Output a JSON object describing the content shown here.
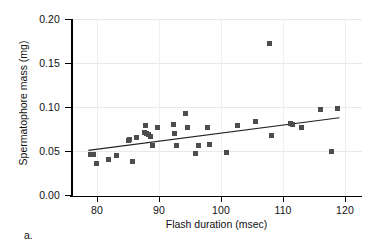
{
  "figure": {
    "panel_letter": "a.",
    "background": "#ffffff",
    "marker_color": "#4d4d4d",
    "axis_color": "#000000",
    "grid_color": "#e9e9e9"
  },
  "chart_data": {
    "type": "scatter",
    "title": "",
    "xlabel": "Flash duration (msec)",
    "ylabel": "Spermatophore mass (mg)",
    "xlim": [
      75.2,
      122.5
    ],
    "ylim": [
      0.0,
      0.205
    ],
    "xticks": [
      80,
      90,
      100,
      110,
      120
    ],
    "xticklabels": [
      "80",
      "90",
      "100",
      "110",
      "120"
    ],
    "yticks": [
      0.0,
      0.05,
      0.1,
      0.15,
      0.2
    ],
    "yticklabels": [
      "0.00",
      "0.05",
      "0.10",
      "0.15",
      "0.20"
    ],
    "grid": true,
    "legend": null,
    "x": [
      78.9,
      79.5,
      79.9,
      81.9,
      83.2,
      85.1,
      85.3,
      85.8,
      86.3,
      87.6,
      87.9,
      88.0,
      88.3,
      88.6,
      88.9,
      89.8,
      92.3,
      92.5,
      92.8,
      94.2,
      94.6,
      95.9,
      96.3,
      97.8,
      98.1,
      100.9,
      102.7,
      105.6,
      107.9,
      108.1,
      111.2,
      111.5,
      113.0,
      116.0,
      117.9,
      118.8
    ],
    "y": [
      0.047,
      0.047,
      0.037,
      0.041,
      0.046,
      0.063,
      0.064,
      0.039,
      0.066,
      0.072,
      0.08,
      0.071,
      0.07,
      0.067,
      0.057,
      0.077,
      0.081,
      0.071,
      0.057,
      0.093,
      0.078,
      0.048,
      0.057,
      0.077,
      0.058,
      0.049,
      0.08,
      0.084,
      0.173,
      0.068,
      0.082,
      0.081,
      0.078,
      0.098,
      0.05,
      0.099
    ],
    "trendline": {
      "type": "linear-fit",
      "x_start": 78.6,
      "y_start": 0.0515,
      "x_end": 119.1,
      "y_end": 0.0885
    },
    "n_points": 36
  }
}
